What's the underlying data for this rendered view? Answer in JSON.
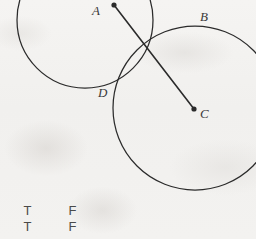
{
  "figure": {
    "background_color": "#f3f2f0",
    "ink_color": "#2b2b2b",
    "width": 256,
    "height": 239,
    "circles": [
      {
        "name": "circle-left",
        "cx": 85,
        "cy": 20,
        "r": 68
      },
      {
        "name": "circle-right",
        "cx": 195,
        "cy": 108,
        "r": 82
      }
    ],
    "segment": {
      "name": "segment-AC",
      "x1": 114,
      "y1": 5,
      "x2": 194,
      "y2": 109
    },
    "points": [
      {
        "id": "A",
        "label": "A",
        "x": 114,
        "y": 5,
        "label_x": 92,
        "label_y": 4,
        "dot": true
      },
      {
        "id": "B",
        "label": "B",
        "x": 196,
        "y": 21,
        "label_x": 200,
        "label_y": 10,
        "dot": false
      },
      {
        "id": "C",
        "label": "C",
        "x": 194,
        "y": 109,
        "label_x": 200,
        "label_y": 107,
        "dot": true
      },
      {
        "id": "D",
        "label": "D",
        "x": 115,
        "y": 88,
        "label_x": 98,
        "label_y": 86,
        "dot": false
      }
    ]
  },
  "answer_options": {
    "rows": [
      {
        "true_label": "T",
        "false_label": "F"
      },
      {
        "true_label": "T",
        "false_label": "F"
      }
    ]
  }
}
